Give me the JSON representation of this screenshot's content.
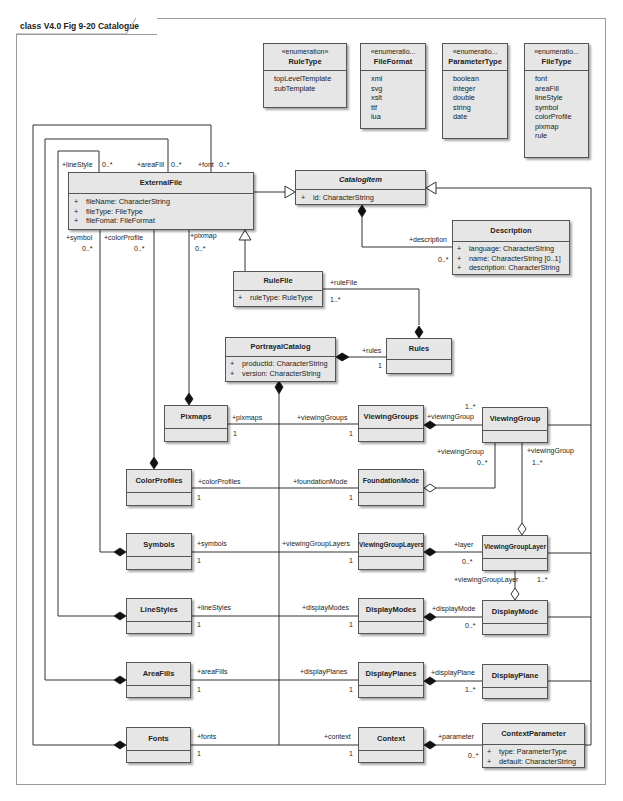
{
  "diagram": {
    "title": "class V4.0 Fig 9-20 Catalogue"
  },
  "enumerations": [
    {
      "stereotype": "«enumeration»",
      "name": "RuleType",
      "literals": [
        "topLevelTemplate",
        "subTemplate"
      ]
    },
    {
      "stereotype": "«enumeratio...",
      "name": "FileFormat",
      "literals": [
        "xml",
        "svg",
        "xslt",
        "ttf",
        "lua"
      ]
    },
    {
      "stereotype": "«enumeratio...",
      "name": "ParameterType",
      "literals": [
        "boolean",
        "integer",
        "double",
        "string",
        "date"
      ]
    },
    {
      "stereotype": "«enumeratio...",
      "name": "FileType",
      "literals": [
        "font",
        "areaFill",
        "lineStyle",
        "symbol",
        "colorProfile",
        "pixmap",
        "rule"
      ]
    }
  ],
  "classes": {
    "externalFile": {
      "name": "ExternalFile",
      "attributes": [
        {
          "vis": "+",
          "text": "fileName:  CharacterString"
        },
        {
          "vis": "+",
          "text": "fileType:  FileType"
        },
        {
          "vis": "+",
          "text": "fileFomat:  FileFormat"
        }
      ]
    },
    "catalogItem": {
      "name": "CatalogItem",
      "abstract": true,
      "attributes": [
        {
          "vis": "+",
          "text": "id:  CharacterString"
        }
      ]
    },
    "description": {
      "name": "Description",
      "attributes": [
        {
          "vis": "+",
          "text": "language:  CharacterString"
        },
        {
          "vis": "+",
          "text": "name:  CharacterString [0..1]"
        },
        {
          "vis": "+",
          "text": "description:  CharacterString"
        }
      ]
    },
    "ruleFile": {
      "name": "RuleFile",
      "attributes": [
        {
          "vis": "+",
          "text": "ruleType:  RuleType"
        }
      ]
    },
    "portrayalCatalog": {
      "name": "PortrayalCatalog",
      "attributes": [
        {
          "vis": "+",
          "text": "productId:  CharacterString"
        },
        {
          "vis": "+",
          "text": "version:  CharacterString"
        }
      ]
    },
    "rules": {
      "name": "Rules"
    },
    "pixmaps": {
      "name": "Pixmaps"
    },
    "colorProfiles": {
      "name": "ColorProfiles"
    },
    "symbols": {
      "name": "Symbols"
    },
    "lineStyles": {
      "name": "LineStyles"
    },
    "areaFills": {
      "name": "AreaFills"
    },
    "fonts": {
      "name": "Fonts"
    },
    "viewingGroups": {
      "name": "ViewingGroups"
    },
    "foundationMode": {
      "name": "FoundationMode"
    },
    "viewingGroupLayers": {
      "name": "ViewingGroupLayers"
    },
    "displayModes": {
      "name": "DisplayModes"
    },
    "displayPlanes": {
      "name": "DisplayPlanes"
    },
    "context": {
      "name": "Context"
    },
    "viewingGroup": {
      "name": "ViewingGroup"
    },
    "viewingGroupLayer": {
      "name": "ViewingGroupLayer"
    },
    "displayMode": {
      "name": "DisplayMode"
    },
    "displayPlane": {
      "name": "DisplayPlane"
    },
    "contextParameter": {
      "name": "ContextParameter",
      "attributes": [
        {
          "vis": "+",
          "text": "type:  ParameterType"
        },
        {
          "vis": "+",
          "text": "default:  CharacterString"
        }
      ]
    }
  },
  "labels": {
    "lineStyle": "+lineStyle",
    "lineStyleMult": "0..*",
    "areaFill": "+areaFill",
    "areaFillMult": "0..*",
    "font": "+font",
    "fontMult": "0..*",
    "symbol": "+symbol",
    "symbolMult": "0..*",
    "colorProfile": "+colorProfile",
    "colorProfileMult": "0..*",
    "pixmap": "+pixmap",
    "pixmapMult": "0..*",
    "description": "+description",
    "descriptionMult": "0..*",
    "ruleFile": "+ruleFile",
    "ruleFileMult": "1..*",
    "rules": "+rules",
    "rulesMult": "1",
    "pixmaps": "+pixmaps",
    "pixmapsMult": "1",
    "colorProfiles": "+colorProfiles",
    "colorProfilesMult": "1",
    "symbols": "+symbols",
    "symbolsMult": "1",
    "lineStyles": "+lineStyles",
    "lineStylesMult": "1",
    "areaFills": "+areaFills",
    "areaFillsMult": "1",
    "fonts": "+fonts",
    "fontsMult": "1",
    "viewingGroups": "+viewingGroups",
    "viewingGroupsMult": "1",
    "foundationMode": "+foundationMode",
    "foundationModeMult": "1",
    "viewingGroupLayers": "+viewingGroupLayers",
    "viewingGroupLayersMult": "1",
    "displayModes": "+displayModes",
    "displayModesMult": "1",
    "displayPlanes": "+displayPlanes",
    "displayPlanesMult": "1",
    "context": "+context",
    "contextMult": "1",
    "vgFromVGs": "+viewingGroup",
    "vgFromVGsMult": "1..*",
    "vgFromFM": "+viewingGroup",
    "vgFromFMMult": "0..*",
    "vgFromVGL": "+viewingGroup",
    "vgFromVGLMult": "1..*",
    "layer": "+layer",
    "layerMult": "0..*",
    "vglFromDM": "+viewingGroupLayer",
    "vglFromDMMult": "1..*",
    "displayMode": "+displayMode",
    "displayModeMult": "0..*",
    "displayPlane": "+displayPlane",
    "displayPlaneMult": "1..*",
    "parameter": "+parameter",
    "parameterMult": "0..*"
  }
}
